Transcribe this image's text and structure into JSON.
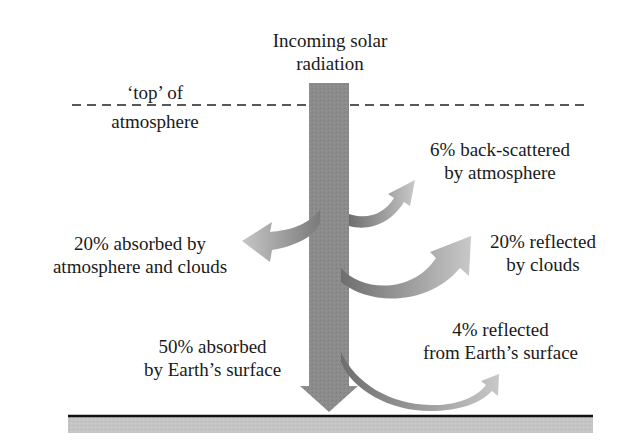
{
  "title": "Incoming solar radiation",
  "colors": {
    "main_beam": "#8a8a8a",
    "branch_arrow_light": "#c4c4c4",
    "branch_arrow_dark": "#7a7a7a",
    "ground_fill": "#c2c2c2",
    "ground_line": "#111111",
    "text": "#1a1a1a",
    "dashed_line": "#222222"
  },
  "labels": {
    "incoming": {
      "line1": "Incoming solar",
      "line2": "radiation"
    },
    "top_of_atmosphere": {
      "line1": "‘top’ of",
      "line2": "atmosphere"
    },
    "back_scattered": {
      "line1": "6% back-scattered",
      "line2": "by atmosphere"
    },
    "absorbed_atmosphere": {
      "line1": "20% absorbed by",
      "line2": "atmosphere and clouds"
    },
    "reflected_clouds": {
      "line1": "20% reflected",
      "line2": "by clouds"
    },
    "absorbed_surface": {
      "line1": "50% absorbed",
      "line2": "by Earth’s surface"
    },
    "reflected_surface": {
      "line1": "4% reflected",
      "line2": "from Earth’s surface"
    }
  },
  "budget": [
    {
      "component": "back-scattered by atmosphere",
      "percent": 6,
      "direction": "up-right"
    },
    {
      "component": "absorbed by atmosphere and clouds",
      "percent": 20,
      "direction": "left"
    },
    {
      "component": "reflected by clouds",
      "percent": 20,
      "direction": "up-right"
    },
    {
      "component": "reflected from Earth's surface",
      "percent": 4,
      "direction": "up-right"
    },
    {
      "component": "absorbed by Earth's surface",
      "percent": 50,
      "direction": "down"
    }
  ]
}
